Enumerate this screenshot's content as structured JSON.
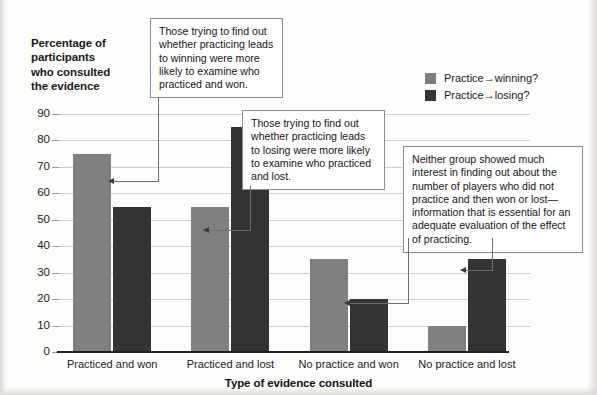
{
  "chart_data": {
    "type": "bar",
    "title": "",
    "ylabel": "Percentage of participants who consulted the evidence",
    "xlabel": "Type of evidence consulted",
    "categories": [
      "Practiced and won",
      "Practiced and lost",
      "No practice and won",
      "No practice and lost"
    ],
    "series": [
      {
        "name": "Practice→winning?",
        "color": "#7f7f7f",
        "values": [
          75,
          55,
          35,
          10
        ]
      },
      {
        "name": "Practice→losing?",
        "color": "#333333",
        "values": [
          55,
          85,
          20,
          35
        ]
      }
    ],
    "ylim": [
      0,
      90
    ],
    "yticks": [
      0,
      10,
      20,
      30,
      40,
      50,
      60,
      70,
      80,
      90
    ],
    "ytick_labels": [
      "0",
      "10",
      "20",
      "30",
      "40",
      "50",
      "60",
      "70",
      "80",
      "90"
    ],
    "grid": true,
    "legend_position": "top-right"
  },
  "axes": {
    "y_title_lines": [
      "Percentage of",
      "participants",
      "who consulted",
      "the evidence"
    ],
    "x_title": "Type of evidence consulted"
  },
  "legend": {
    "items": [
      {
        "label": "Practice→winning?",
        "color": "#7f7f7f"
      },
      {
        "label": "Practice→losing?",
        "color": "#333333"
      }
    ]
  },
  "callouts": [
    {
      "id": "callout-1",
      "text": "Those trying to find out whether practicing leads to winning were more likely to examine who practiced and won.",
      "points_to": "Practiced and won / Practice→winning? bar"
    },
    {
      "id": "callout-2",
      "text": "Those trying to find out whether practicing leads to losing were more likely to examine who practiced and lost.",
      "points_to": "Practiced and lost / Practice→losing? bar"
    },
    {
      "id": "callout-3",
      "text": "Neither group showed much interest in finding out about the number of players who did not practice and then won or lost—information that is essential for an adequate evaluation of the effect of practicing.",
      "points_to": "No practice and won / No practice and lost bars"
    }
  ],
  "colors": {
    "bar_light": "#7f7f7f",
    "bar_dark": "#333333",
    "gridline": "#cfcfcf",
    "axis": "#1f1f1f",
    "callout_border": "#8d8d8d",
    "leader_line": "#6d6d6d"
  }
}
